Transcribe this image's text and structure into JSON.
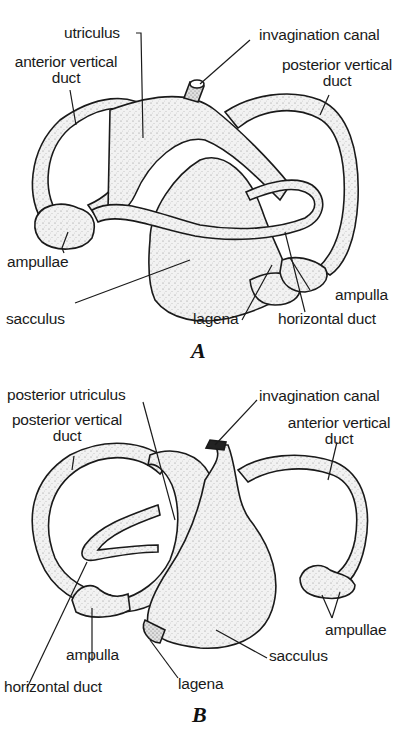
{
  "figure": {
    "panels": [
      {
        "id": "A",
        "letter": "A",
        "labels": {
          "utriculus": "utriculus",
          "invagination_canal": "invagination canal",
          "anterior_vertical_duct_1": "anterior vertical",
          "anterior_vertical_duct_2": "duct",
          "posterior_vertical_duct_1": "posterior vertical",
          "posterior_vertical_duct_2": "duct",
          "ampullae": "ampullae",
          "sacculus": "sacculus",
          "lagena": "lagena",
          "ampulla": "ampulla",
          "horizontal_duct": "horizontal duct"
        }
      },
      {
        "id": "B",
        "letter": "B",
        "labels": {
          "posterior_utriculus": "posterior utriculus",
          "posterior_vertical_duct_1": "posterior vertical",
          "posterior_vertical_duct_2": "duct",
          "invagination_canal": "invagination canal",
          "anterior_vertical_duct_1": "anterior vertical",
          "anterior_vertical_duct_2": "duct",
          "ampullae": "ampullae",
          "ampulla": "ampulla",
          "sacculus": "sacculus",
          "horizontal_duct": "horizontal duct",
          "lagena": "lagena"
        }
      }
    ],
    "colors": {
      "ink": "#1a1a1a",
      "fill": "#ececec",
      "background": "#ffffff"
    }
  }
}
